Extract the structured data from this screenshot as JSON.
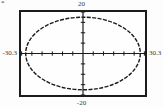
{
  "page": {
    "corner_mark": "*"
  },
  "colors": {
    "ink": "#1a1a1a",
    "border": "#1c1c1c",
    "label": "#3a3a3a",
    "background": "#fdfdfd"
  },
  "chart_data": {
    "type": "line",
    "title": "",
    "window": {
      "xmin": -30.3,
      "xmax": 30.3,
      "ymin": -20,
      "ymax": 20,
      "xscl": 5,
      "yscl": 5
    },
    "axis_labels": {
      "top": "20",
      "bottom": "-20",
      "left": "-30.3",
      "right": "30.3"
    },
    "series": [
      {
        "name": "ellipse",
        "shape": "ellipse",
        "cx": 0,
        "cy": 0,
        "semi_axis_x": 28,
        "semi_axis_y": 17.5
      }
    ],
    "grid": false,
    "legend": false,
    "curve_style": "dashed-segments"
  }
}
